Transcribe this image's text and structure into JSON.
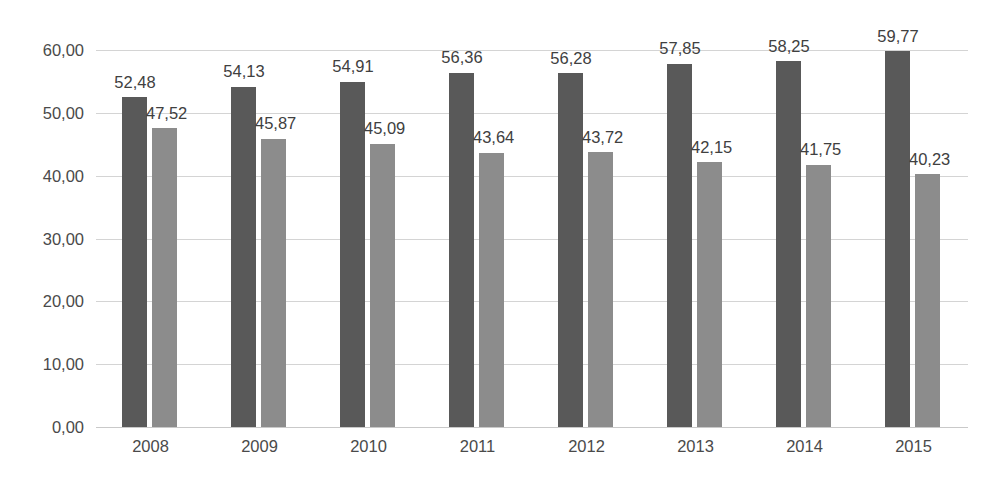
{
  "chart_data": {
    "type": "bar",
    "title": "",
    "subtitle": "",
    "xlabel": "",
    "ylabel": "",
    "categories": [
      "2008",
      "2009",
      "2010",
      "2011",
      "2012",
      "2013",
      "2014",
      "2015"
    ],
    "series": [
      {
        "name": "series-1",
        "color": "#595959",
        "values": [
          52.48,
          54.13,
          54.91,
          56.36,
          56.28,
          57.85,
          58.25,
          59.77
        ],
        "labels": [
          "52,48",
          "54,13",
          "54,91",
          "56,36",
          "56,28",
          "57,85",
          "58,25",
          "59,77"
        ]
      },
      {
        "name": "series-2",
        "color": "#8c8c8c",
        "values": [
          47.52,
          45.87,
          45.09,
          43.64,
          43.72,
          42.15,
          41.75,
          40.23
        ],
        "labels": [
          "47,52",
          "45,87",
          "45,09",
          "43,64",
          "43,72",
          "42,15",
          "41,75",
          "40,23"
        ]
      }
    ],
    "ylim": [
      0,
      60
    ],
    "y_ticks": [
      0,
      10,
      20,
      30,
      40,
      50,
      60
    ],
    "y_tick_labels": [
      "0,00",
      "10,00",
      "20,00",
      "30,00",
      "40,00",
      "50,00",
      "60,00"
    ],
    "grid": true,
    "legend": "none",
    "decimal_separator": ",",
    "colors": {
      "series_1": "#595959",
      "series_2": "#8c8c8c",
      "gridline": "#d4d4d4",
      "text": "#404040",
      "background": "#ffffff"
    }
  }
}
